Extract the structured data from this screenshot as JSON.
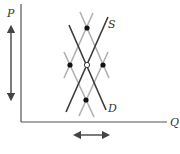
{
  "diagram": {
    "type": "supply-demand",
    "axes": {
      "y_label": "P",
      "x_label": "Q"
    },
    "curves": {
      "supply_label": "S",
      "demand_label": "D"
    },
    "colors": {
      "axis": "#555555",
      "main_line": "#3a3a3a",
      "shifted_line": "#b0b0b0",
      "point": "#111111",
      "arrow": "#444444"
    },
    "points": {
      "equilibrium": "open",
      "shifted": [
        "top",
        "left",
        "right",
        "bottom"
      ]
    },
    "arrows": {
      "price_range": "vertical double arrow",
      "quantity_range": "horizontal double arrow"
    }
  }
}
